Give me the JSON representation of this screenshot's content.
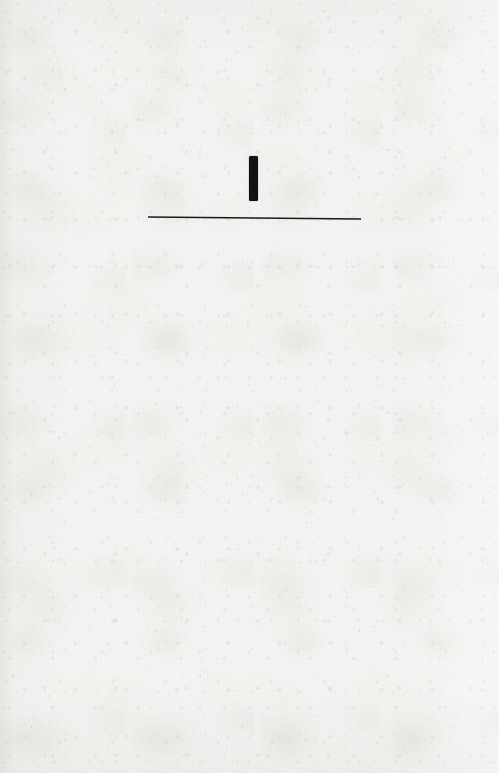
{
  "page": {
    "kind": "scanned-paper-scan",
    "width": 499,
    "height": 773,
    "paper_color": "#f3f3f1",
    "ink_color": "#121212",
    "text_content": "",
    "note": ""
  },
  "marks": {
    "vertical_stroke": {
      "name": "vertical-stroke",
      "x": 249,
      "y": 156,
      "width": 9,
      "height": 45,
      "color": "#121212"
    },
    "horizontal_rule": {
      "name": "horizontal-rule",
      "x": 148,
      "y": 217,
      "width": 213,
      "thickness": 1.6,
      "slope_drop_px": 2,
      "color": "#1a1a1a"
    }
  }
}
